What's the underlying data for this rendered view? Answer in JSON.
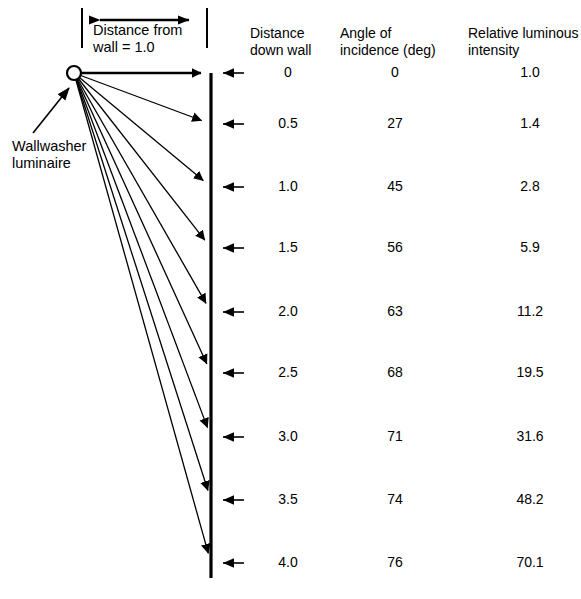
{
  "diagram": {
    "dimension_label": "Distance from\nwall = 1.0",
    "luminaire_label": "Wallwasher\nluminaire",
    "geometry": {
      "source_x": 74,
      "source_y": 73,
      "source_radius": 7,
      "wall_x": 211,
      "wall_top_y": 73,
      "wall_bottom_y": 578,
      "dim_line_y": 20,
      "dim_left_x": 82,
      "dim_right_x": 207,
      "ray_end_y": [
        73,
        124,
        187,
        248,
        312,
        373,
        437,
        500,
        563
      ],
      "ext_arrow_right_x": 244
    },
    "colors": {
      "line": "#000000",
      "text": "#000000",
      "background": "#ffffff"
    }
  },
  "table": {
    "headers": [
      "Distance\ndown wall",
      "Angle of\nincidence (deg)",
      "Relative luminous\nintensity"
    ],
    "rows": [
      {
        "distance": "0",
        "angle": "0",
        "intensity": "1.0"
      },
      {
        "distance": "0.5",
        "angle": "27",
        "intensity": "1.4"
      },
      {
        "distance": "1.0",
        "angle": "45",
        "intensity": "2.8"
      },
      {
        "distance": "1.5",
        "angle": "56",
        "intensity": "5.9"
      },
      {
        "distance": "2.0",
        "angle": "63",
        "intensity": "11.2"
      },
      {
        "distance": "2.5",
        "angle": "68",
        "intensity": "19.5"
      },
      {
        "distance": "3.0",
        "angle": "71",
        "intensity": "31.6"
      },
      {
        "distance": "3.5",
        "angle": "74",
        "intensity": "48.2"
      },
      {
        "distance": "4.0",
        "angle": "76",
        "intensity": "70.1"
      }
    ],
    "row_y": [
      73,
      124,
      187,
      248,
      312,
      373,
      437,
      500,
      563
    ]
  },
  "chart_data": {
    "type": "table",
    "categories": [
      "0",
      "0.5",
      "1.0",
      "1.5",
      "2.0",
      "2.5",
      "3.0",
      "3.5",
      "4.0"
    ],
    "series": [
      {
        "name": "Angle of incidence (deg)",
        "values": [
          0,
          27,
          45,
          56,
          63,
          68,
          71,
          74,
          76
        ]
      },
      {
        "name": "Relative luminous intensity",
        "values": [
          1.0,
          1.4,
          2.8,
          5.9,
          11.2,
          19.5,
          31.6,
          48.2,
          70.1
        ]
      }
    ],
    "xlabel": "Distance down wall",
    "ylabel": "",
    "annotations": [
      "Distance from wall = 1.0",
      "Wallwasher luminaire"
    ],
    "grid": false,
    "legend": "none"
  }
}
